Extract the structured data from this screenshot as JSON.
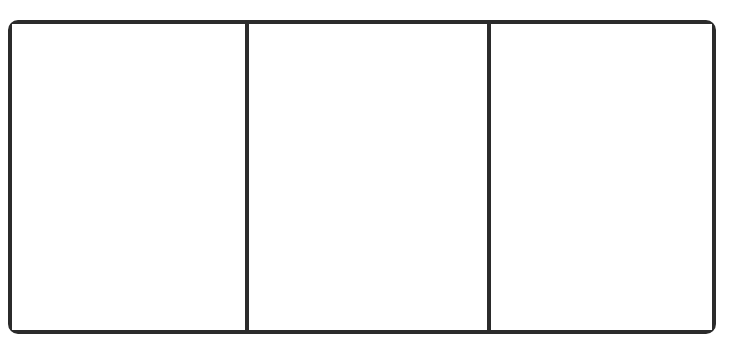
{
  "diagram": {
    "type": "three-panel-frame",
    "panel_count": 3,
    "panels": [
      {
        "index": 1,
        "content": ""
      },
      {
        "index": 2,
        "content": ""
      },
      {
        "index": 3,
        "content": ""
      }
    ],
    "colors": {
      "border": "#2b2b2b",
      "background": "#ffffff"
    }
  }
}
